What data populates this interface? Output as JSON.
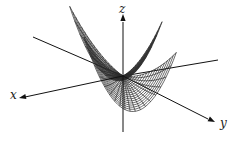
{
  "figure": {
    "type": "3d-wireframe-surface",
    "colors": {
      "mesh": "#2a2a2a",
      "axis": "#111111",
      "background": "#ffffff"
    },
    "axes": {
      "x": {
        "label": "x"
      },
      "y": {
        "label": "y"
      },
      "z": {
        "label": "z"
      }
    }
  }
}
